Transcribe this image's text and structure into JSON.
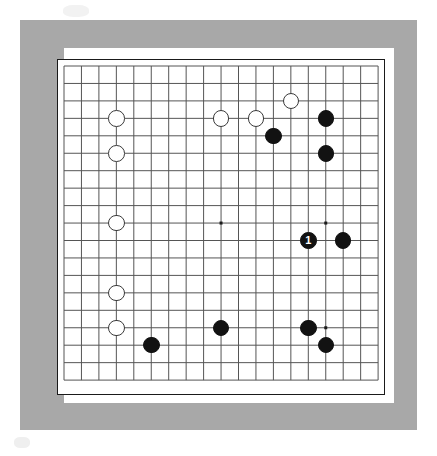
{
  "diagram": {
    "kind": "go-board-diagram",
    "board_size": 19,
    "colors": {
      "frame": "#a8a8a8",
      "mat": "#ffffff",
      "board": "#ffffff",
      "board_border": "#1a1a1a",
      "grid_line": "#555555",
      "star_point": "#1a1a1a",
      "black_stone": "#121212",
      "white_stone": "#ffffff",
      "white_stone_border": "#3a3a3a",
      "label_text": "#ffffff"
    },
    "geometry": {
      "grid_left": 7,
      "grid_top": 7,
      "cell": 17.45,
      "lines": 19,
      "stone_diameter": 16.5,
      "star_dot_size": 3
    },
    "star_points": [
      {
        "col": 3,
        "row": 3
      },
      {
        "col": 9,
        "row": 3
      },
      {
        "col": 15,
        "row": 3
      },
      {
        "col": 3,
        "row": 9
      },
      {
        "col": 9,
        "row": 9
      },
      {
        "col": 15,
        "row": 9
      },
      {
        "col": 3,
        "row": 15
      },
      {
        "col": 9,
        "row": 15
      },
      {
        "col": 15,
        "row": 15
      }
    ],
    "stones": [
      {
        "col": 3,
        "row": 3,
        "color": "white",
        "label": ""
      },
      {
        "col": 3,
        "row": 5,
        "color": "white",
        "label": ""
      },
      {
        "col": 3,
        "row": 9,
        "color": "white",
        "label": ""
      },
      {
        "col": 3,
        "row": 13,
        "color": "white",
        "label": ""
      },
      {
        "col": 3,
        "row": 15,
        "color": "white",
        "label": ""
      },
      {
        "col": 9,
        "row": 3,
        "color": "white",
        "label": ""
      },
      {
        "col": 11,
        "row": 3,
        "color": "white",
        "label": ""
      },
      {
        "col": 13,
        "row": 2,
        "color": "white",
        "label": ""
      },
      {
        "col": 12,
        "row": 4,
        "color": "black",
        "label": ""
      },
      {
        "col": 15,
        "row": 3,
        "color": "black",
        "label": ""
      },
      {
        "col": 15,
        "row": 5,
        "color": "black",
        "label": ""
      },
      {
        "col": 14,
        "row": 10,
        "color": "black",
        "label": "1"
      },
      {
        "col": 16,
        "row": 10,
        "color": "black",
        "label": ""
      },
      {
        "col": 5,
        "row": 16,
        "color": "black",
        "label": ""
      },
      {
        "col": 9,
        "row": 15,
        "color": "black",
        "label": ""
      },
      {
        "col": 14,
        "row": 15,
        "color": "black",
        "label": ""
      },
      {
        "col": 15,
        "row": 16,
        "color": "black",
        "label": ""
      }
    ]
  }
}
